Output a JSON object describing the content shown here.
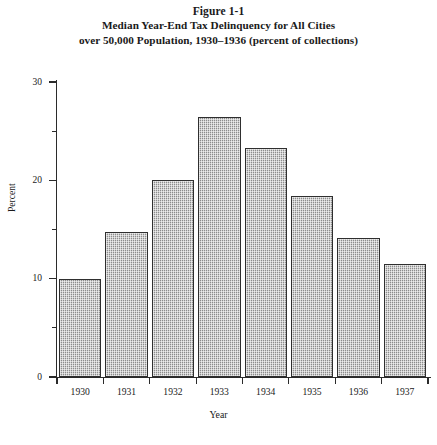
{
  "figure": {
    "number": "Figure 1-1",
    "subtitle_line_1": "Median Year-End Tax Delinquency for All Cities",
    "subtitle_line_2": "over 50,000 Population, 1930–1936 (percent of collections)"
  },
  "chart_data": {
    "type": "bar",
    "title": "Median Year-End Tax Delinquency for All Cities over 50,000 Population, 1930–1936 (percent of collections)",
    "figure_label": "Figure 1-1",
    "categories": [
      "1930",
      "1931",
      "1932",
      "1933",
      "1934",
      "1935",
      "1936",
      "1937"
    ],
    "values": [
      10.0,
      14.7,
      20.0,
      26.4,
      23.3,
      18.4,
      14.1,
      11.5
    ],
    "xlabel": "Year",
    "ylabel": "Percent",
    "ylim": [
      0,
      30
    ],
    "yticks": [
      0,
      10,
      20,
      30
    ],
    "ytick_labels": [
      "0",
      "10",
      "20",
      "30"
    ],
    "yminor_ticks": [
      5,
      15,
      25
    ],
    "grid": false,
    "legend": null,
    "bar_fill_color": "#a8a8a8",
    "bar_edge_color": "#2f2f2f",
    "axis_color": "#2b2b2b",
    "background_color": "#ffffff"
  },
  "axes": {
    "y_title": "Percent",
    "x_title": "Year"
  }
}
